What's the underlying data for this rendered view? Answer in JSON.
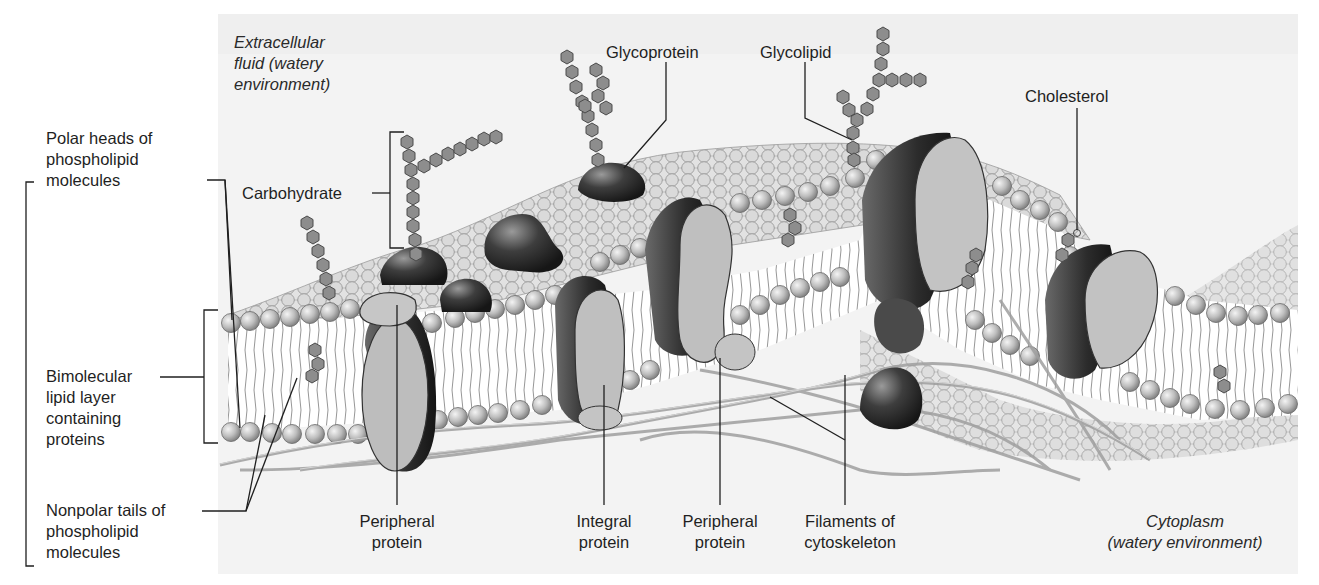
{
  "figure": {
    "background_color": "#f3f3f3",
    "ink_color": "#1f1f1f"
  },
  "labels": {
    "extracellular": "Extracellular\nfluid (watery\nenvironment)",
    "glycoprotein": "Glycoprotein",
    "glycolipid": "Glycolipid",
    "cholesterol": "Cholesterol",
    "carbohydrate": "Carbohydrate",
    "polar_heads": "Polar heads of\nphospholipid\nmolecules",
    "bimolecular": "Bimolecular\nlipid layer\ncontaining\nproteins",
    "nonpolar_tails": "Nonpolar tails of\nphospholipid\nmolecules",
    "peripheral_protein_1": "Peripheral\nprotein",
    "integral_protein": "Integral\nprotein",
    "peripheral_protein_2": "Peripheral\nprotein",
    "filaments": "Filaments of\ncytoskeleton",
    "cytoplasm": "Cytoplasm\n(watery environment)"
  }
}
